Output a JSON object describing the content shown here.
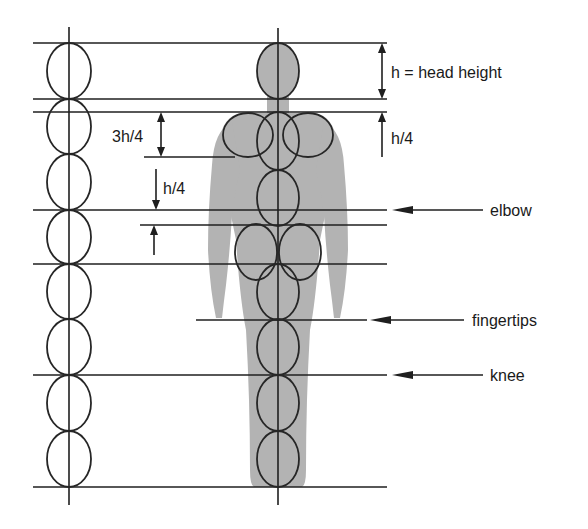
{
  "diagram": {
    "unit_label": "h = head height",
    "head_units": 8,
    "colors": {
      "line": "#1f1f1f",
      "silhouette": "#b3b3b3",
      "background": "#ffffff"
    },
    "dimension_labels": {
      "head_height": "h = head height",
      "shoulder_offset": "h/4",
      "shoulder_drop": "3h/4",
      "upper_gap": "h/4"
    },
    "landmarks": [
      {
        "name": "elbow",
        "label": "elbow"
      },
      {
        "name": "fingertips",
        "label": "fingertips"
      },
      {
        "name": "knee",
        "label": "knee"
      }
    ]
  }
}
